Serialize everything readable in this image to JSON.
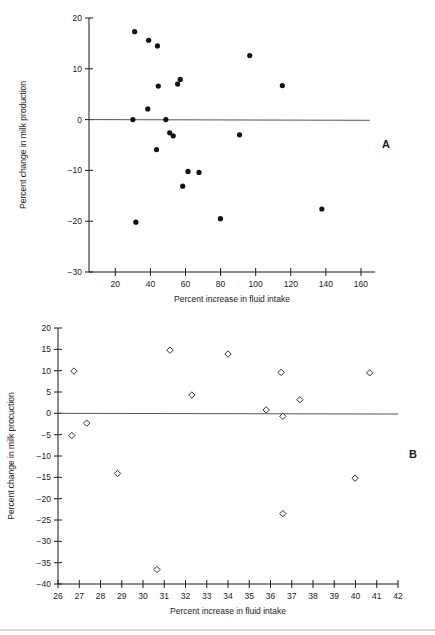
{
  "figure": {
    "panels": [
      {
        "letter": "A",
        "xlabel": "Percent increase in fluid intake",
        "ylabel": "Percent change in milk production"
      },
      {
        "letter": "B",
        "xlabel": "Percent increase in fluid intake",
        "ylabel": "Percent change in milk procuction"
      }
    ]
  },
  "chart_data": [
    {
      "type": "scatter",
      "title": "",
      "panel": "A",
      "xlabel": "Percent increase in fluid intake",
      "ylabel": "Percent change in milk production",
      "xlim": [
        5,
        168
      ],
      "ylim": [
        -30,
        20
      ],
      "xticks": [
        20,
        40,
        60,
        80,
        100,
        120,
        140,
        160
      ],
      "yticks": [
        -30,
        -20,
        -10,
        0,
        10,
        20
      ],
      "grid": false,
      "legend": false,
      "marker": "filled-circle",
      "reference_line": {
        "y": 0,
        "from_x": 5,
        "to_x": 165
      },
      "points": [
        {
          "x": 31.0,
          "y": 17.3
        },
        {
          "x": 39.0,
          "y": 15.6
        },
        {
          "x": 44.0,
          "y": 14.5
        },
        {
          "x": 44.5,
          "y": 6.6
        },
        {
          "x": 55.5,
          "y": 7.0
        },
        {
          "x": 57.0,
          "y": 7.9
        },
        {
          "x": 38.5,
          "y": 2.1
        },
        {
          "x": 30.0,
          "y": 0.0
        },
        {
          "x": 48.8,
          "y": 0.0
        },
        {
          "x": 51.0,
          "y": -2.6
        },
        {
          "x": 53.0,
          "y": -3.2
        },
        {
          "x": 43.5,
          "y": -5.9
        },
        {
          "x": 61.4,
          "y": -10.2
        },
        {
          "x": 67.7,
          "y": -10.4
        },
        {
          "x": 58.4,
          "y": -13.1
        },
        {
          "x": 31.7,
          "y": -20.2
        },
        {
          "x": 79.9,
          "y": -19.5
        },
        {
          "x": 96.6,
          "y": 12.6
        },
        {
          "x": 115.2,
          "y": 6.7
        },
        {
          "x": 90.8,
          "y": -3.0
        },
        {
          "x": 137.7,
          "y": -17.6
        }
      ]
    },
    {
      "type": "scatter",
      "title": "",
      "panel": "B",
      "xlabel": "Percent increase in fluid intake",
      "ylabel": "Percent change in milk procuction",
      "xlim": [
        26,
        42
      ],
      "ylim": [
        -40,
        20
      ],
      "xticks": [
        26,
        27,
        28,
        29,
        30,
        31,
        32,
        33,
        34,
        35,
        36,
        37,
        38,
        39,
        40,
        41,
        42
      ],
      "yticks": [
        -40,
        -35,
        -30,
        -25,
        -20,
        -15,
        -10,
        -5,
        0,
        5,
        10,
        15,
        20
      ],
      "grid": false,
      "legend": false,
      "marker": "open-diamond",
      "reference_line": {
        "y": 0,
        "from_x": 26,
        "to_x": 42
      },
      "points": [
        {
          "x": 26.75,
          "y": 9.9
        },
        {
          "x": 26.65,
          "y": -5.2
        },
        {
          "x": 27.35,
          "y": -2.3
        },
        {
          "x": 28.8,
          "y": -14.1
        },
        {
          "x": 30.66,
          "y": -36.6
        },
        {
          "x": 31.27,
          "y": 14.8
        },
        {
          "x": 32.3,
          "y": 4.3
        },
        {
          "x": 34.0,
          "y": 13.9
        },
        {
          "x": 35.8,
          "y": 0.8
        },
        {
          "x": 36.5,
          "y": 9.6
        },
        {
          "x": 36.58,
          "y": -0.7
        },
        {
          "x": 36.58,
          "y": -23.5
        },
        {
          "x": 37.38,
          "y": 3.2
        },
        {
          "x": 39.98,
          "y": -15.2
        },
        {
          "x": 40.67,
          "y": 9.5
        }
      ]
    }
  ]
}
